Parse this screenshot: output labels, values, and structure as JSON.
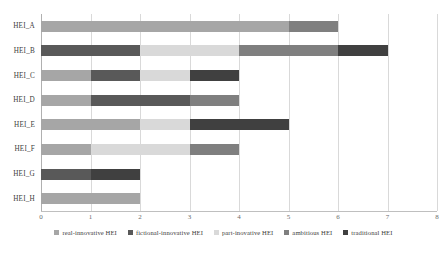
{
  "chart_data": {
    "type": "bar",
    "orientation": "horizontal",
    "stacked": true,
    "title": "",
    "xlabel": "",
    "ylabel": "",
    "xlim": [
      0,
      8
    ],
    "grid": true,
    "legend_position": "bottom",
    "categories": [
      "HEI_A",
      "HEI_B",
      "HEI_C",
      "HEI_D",
      "HEI_E",
      "HEI_F",
      "HEI_G",
      "HEI_H"
    ],
    "xticks": [
      "0",
      "1",
      "2",
      "3",
      "4",
      "5",
      "6",
      "7",
      "8"
    ],
    "series": [
      {
        "name": "real-innovative HEI",
        "color": "#a6a6a6",
        "values": [
          5,
          0,
          1,
          1,
          2,
          1,
          0,
          2
        ]
      },
      {
        "name": "fictional-innovative HEI",
        "color": "#595959",
        "values": [
          0,
          2,
          1,
          2,
          0,
          0,
          1,
          0
        ]
      },
      {
        "name": "part-inovative HEI",
        "color": "#d9d9d9",
        "values": [
          0,
          2,
          1,
          0,
          1,
          2,
          0,
          0
        ]
      },
      {
        "name": "ambitious HEI",
        "color": "#7f7f7f",
        "values": [
          1,
          2,
          0,
          1,
          0,
          1,
          0,
          0
        ]
      },
      {
        "name": "traditional HEI",
        "color": "#404040",
        "values": [
          0,
          1,
          1,
          0,
          2,
          0,
          1,
          0
        ]
      }
    ],
    "totals": [
      6,
      7,
      4,
      4,
      5,
      4,
      2,
      2
    ]
  },
  "caption": {
    "text": ""
  }
}
